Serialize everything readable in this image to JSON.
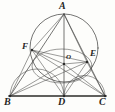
{
  "figure": {
    "background_color": "#fdfdfb",
    "line_color": "#3b3b39",
    "base_line_color": "#2b2b29",
    "label_color": "#262624",
    "width": 115,
    "height": 112
  },
  "points": [
    {
      "id": "A",
      "label": "A",
      "x": 64,
      "y": 14,
      "label_x": 59,
      "label_y": 1,
      "size": "lbl-lg",
      "dot": false
    },
    {
      "id": "F",
      "label": "F",
      "x": 32,
      "y": 50,
      "label_x": 22,
      "label_y": 42,
      "size": "lbl-md",
      "dot": true
    },
    {
      "id": "E",
      "label": "E",
      "x": 87,
      "y": 62,
      "label_x": 90,
      "label_y": 49,
      "size": "lbl-md",
      "dot": true
    },
    {
      "id": "O",
      "label": "O",
      "x": 64,
      "y": 64,
      "label_x": 66,
      "label_y": 54,
      "size": "lbl-sm",
      "dot": true
    },
    {
      "id": "B",
      "label": "B",
      "x": 10,
      "y": 96,
      "label_x": 4,
      "label_y": 97,
      "size": "lbl-lg",
      "dot": true
    },
    {
      "id": "D",
      "label": "D",
      "x": 64,
      "y": 96,
      "label_x": 58,
      "label_y": 97,
      "size": "lbl-lg",
      "dot": true
    },
    {
      "id": "C",
      "label": "C",
      "x": 105,
      "y": 96,
      "label_x": 99,
      "label_y": 97,
      "size": "lbl-lg",
      "dot": true
    }
  ],
  "segments": [
    {
      "name": "side-AB",
      "x1": 64,
      "y1": 14,
      "x2": 10,
      "y2": 96,
      "weight": "stroke-med"
    },
    {
      "name": "side-AC",
      "x1": 64,
      "y1": 14,
      "x2": 105,
      "y2": 96,
      "weight": "stroke-med"
    },
    {
      "name": "altitude-AD",
      "x1": 64,
      "y1": 14,
      "x2": 64,
      "y2": 96,
      "weight": "stroke-med"
    },
    {
      "name": "cevian-AE",
      "x1": 64,
      "y1": 14,
      "x2": 87,
      "y2": 62,
      "weight": "stroke-thin"
    },
    {
      "name": "cevian-AF",
      "x1": 64,
      "y1": 14,
      "x2": 32,
      "y2": 50,
      "weight": "stroke-thin"
    },
    {
      "name": "chord-FE",
      "x1": 32,
      "y1": 50,
      "x2": 87,
      "y2": 62,
      "weight": "stroke-thin"
    },
    {
      "name": "chord-FO",
      "x1": 32,
      "y1": 50,
      "x2": 64,
      "y2": 64,
      "weight": "stroke-thin"
    },
    {
      "name": "chord-OE",
      "x1": 64,
      "y1": 64,
      "x2": 87,
      "y2": 62,
      "weight": "stroke-thin"
    },
    {
      "name": "segment-FD",
      "x1": 32,
      "y1": 50,
      "x2": 64,
      "y2": 96,
      "weight": "stroke-thin"
    },
    {
      "name": "segment-FC",
      "x1": 32,
      "y1": 50,
      "x2": 105,
      "y2": 96,
      "weight": "stroke-thin"
    },
    {
      "name": "segment-ED",
      "x1": 87,
      "y1": 62,
      "x2": 64,
      "y2": 96,
      "weight": "stroke-thin"
    },
    {
      "name": "segment-EB",
      "x1": 87,
      "y1": 62,
      "x2": 10,
      "y2": 96,
      "weight": "stroke-thin"
    },
    {
      "name": "segment-EC",
      "x1": 87,
      "y1": 62,
      "x2": 105,
      "y2": 96,
      "weight": "stroke-thin"
    },
    {
      "name": "segment-BF",
      "x1": 10,
      "y1": 96,
      "x2": 32,
      "y2": 50,
      "weight": "stroke-thin"
    },
    {
      "name": "segment-BO",
      "x1": 10,
      "y1": 96,
      "x2": 64,
      "y2": 64,
      "weight": "stroke-thin"
    },
    {
      "name": "segment-CO",
      "x1": 105,
      "y1": 96,
      "x2": 64,
      "y2": 64,
      "weight": "stroke-thin"
    },
    {
      "name": "base-BC",
      "x1": 9,
      "y1": 96,
      "x2": 106,
      "y2": 96,
      "weight": "stroke-base"
    }
  ],
  "circles": [
    {
      "name": "circumcircle-of-AFE",
      "cx": 64,
      "cy": 48,
      "r": 34,
      "weight": "stroke-med"
    },
    {
      "name": "inner-circle-through-F-E-D",
      "cx": 62,
      "cy": 66,
      "rx": 30,
      "ry": 17,
      "weight": "stroke-thin"
    }
  ],
  "arcs": [
    {
      "name": "semicircle-on-BD",
      "d": "M 10 96 A 27 27 0 0 1 64 96",
      "weight": "stroke-thin"
    },
    {
      "name": "semicircle-on-DC",
      "d": "M 64 96 A 20.5 20.5 0 0 1 105 96",
      "weight": "stroke-thin"
    }
  ]
}
